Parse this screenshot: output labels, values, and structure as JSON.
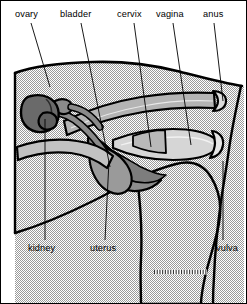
{
  "figure": {
    "width": 247,
    "height": 304,
    "frame_color": "#000000",
    "background_color": "#ffffff"
  },
  "palette": {
    "body_fill": "#e3e3e3",
    "body_outline": "#000000",
    "kidney_fill": "#6e6e6e",
    "ovary_fill": "#777777",
    "uterus_fill": "#8d8d8d",
    "tract_fill": "#b4b4b4",
    "vagina_fill": "#d2d2d2",
    "bladder_fill": "#a8a8a8",
    "leader_color": "#000000",
    "text_color": "#000000"
  },
  "labels": {
    "top": [
      {
        "id": "ovary",
        "text": "ovary",
        "x": 14,
        "y": 8,
        "leader": {
          "x1": 30,
          "y1": 22,
          "x2": 49,
          "y2": 86
        }
      },
      {
        "id": "bladder",
        "text": "bladder",
        "x": 59,
        "y": 8,
        "leader": {
          "x1": 80,
          "y1": 22,
          "x2": 109,
          "y2": 127
        }
      },
      {
        "id": "cervix",
        "text": "cervix",
        "x": 116,
        "y": 8,
        "leader": {
          "x1": 133,
          "y1": 22,
          "x2": 152,
          "y2": 112
        }
      },
      {
        "id": "vagina",
        "text": "vagina",
        "x": 155,
        "y": 8,
        "leader": {
          "x1": 172,
          "y1": 22,
          "x2": 193,
          "y2": 121
        }
      },
      {
        "id": "anus",
        "text": "anus",
        "x": 200,
        "y": 8,
        "leader": {
          "x1": 213,
          "y1": 22,
          "x2": 224,
          "y2": 103
        }
      }
    ],
    "bottom": [
      {
        "id": "kidney",
        "text": "kidney",
        "x": 28,
        "y": 243,
        "leader": {
          "x1": 44,
          "y1": 241,
          "x2": 44,
          "y2": 110
        }
      },
      {
        "id": "uterus",
        "text": "uterus",
        "x": 90,
        "y": 243,
        "leader": {
          "x1": 104,
          "y1": 241,
          "x2": 104,
          "y2": 168
        }
      },
      {
        "id": "vulva",
        "text": "vulva",
        "x": 216,
        "y": 243,
        "leader": {
          "x1": 222,
          "y1": 241,
          "x2": 222,
          "y2": 183
        }
      }
    ]
  },
  "structures": [
    {
      "id": "body",
      "name": "body-outline",
      "fill": "#e3e3e3"
    },
    {
      "id": "kidney",
      "name": "kidney-organ",
      "fill": "#6e6e6e"
    },
    {
      "id": "ovary",
      "name": "ovary-organ",
      "fill": "#777777"
    },
    {
      "id": "oviduct",
      "name": "oviduct-tube",
      "fill": "#8d8d8d"
    },
    {
      "id": "uterus",
      "name": "uterine-horn",
      "fill": "#8d8d8d"
    },
    {
      "id": "bladder",
      "name": "bladder-organ",
      "fill": "#a8a8a8"
    },
    {
      "id": "cervix",
      "name": "cervix-segment",
      "fill": "#b4b4b4"
    },
    {
      "id": "vagina",
      "name": "vagina-canal",
      "fill": "#d2d2d2"
    },
    {
      "id": "rectum",
      "name": "rectum-tube",
      "fill": "#b4b4b4"
    },
    {
      "id": "anus",
      "name": "anus-opening",
      "fill": "#d2d2d2"
    },
    {
      "id": "vulva",
      "name": "vulva-region",
      "fill": "#e3e3e3"
    },
    {
      "id": "leg",
      "name": "hind-leg-region",
      "fill": "#e3e3e3"
    },
    {
      "id": "udder",
      "name": "udder-hatch-detail",
      "fill": "#ffffff"
    }
  ]
}
